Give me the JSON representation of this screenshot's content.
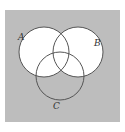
{
  "diagram": {
    "type": "venn",
    "background_color": "#bdbdbd",
    "union_fill": "#ffffff",
    "stroke_color": "#555555",
    "sets": [
      {
        "id": "A",
        "label": "A",
        "cx": 44,
        "cy": 52,
        "r": 25
      },
      {
        "id": "B",
        "label": "B",
        "cx": 78,
        "cy": 52,
        "r": 25
      },
      {
        "id": "C",
        "label": "C",
        "cx": 60,
        "cy": 76,
        "r": 24
      }
    ],
    "shaded_region": "A ∪ B"
  }
}
